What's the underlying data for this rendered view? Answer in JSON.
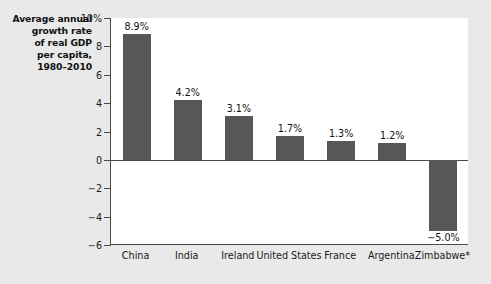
{
  "chart_data": {
    "type": "bar",
    "title": "Average annual growth rate of real GDP per capita, 1980–2010",
    "title_lines": [
      "Average annual",
      "growth rate",
      "of real GDP",
      "per capita,",
      "1980–2010"
    ],
    "xlabel": "",
    "ylabel": "Average annual growth rate of real GDP per capita, 1980–2010",
    "categories": [
      "China",
      "India",
      "Ireland",
      "United States",
      "France",
      "Argentina",
      "Zimbabwe*"
    ],
    "values": [
      8.9,
      4.2,
      3.1,
      1.7,
      1.3,
      1.2,
      -5.0
    ],
    "data_labels": [
      "8.9%",
      "4.2%",
      "3.1%",
      "1.7%",
      "1.3%",
      "1.2%",
      "−5.0%"
    ],
    "ylim": [
      -6,
      10
    ],
    "yticks": [
      10,
      8,
      6,
      4,
      2,
      0,
      -2,
      -4,
      -6
    ],
    "ytick_labels": [
      "10%",
      "8",
      "6",
      "4",
      "2",
      "0",
      "−2",
      "−4",
      "−6"
    ],
    "grid": false,
    "legend": false,
    "bar_color": "#575757",
    "axis_color": "#4a4a4a",
    "plot_background": "#ffffff",
    "figure_background": "#e9e9e9"
  }
}
